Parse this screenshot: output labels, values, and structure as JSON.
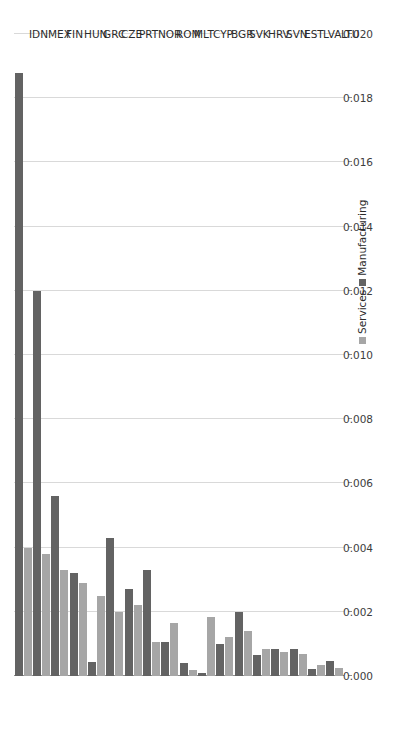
{
  "chart_data": {
    "type": "bar",
    "orientation": "horizontal",
    "title": "",
    "subtitle": "",
    "xlabel": "",
    "ylabel": "",
    "xlim": [
      0.0,
      0.02
    ],
    "xticks": [
      "0.020",
      "0.018",
      "0.016",
      "0.014",
      "0.012",
      "0.010",
      "0.008",
      "0.006",
      "0.004",
      "0.002",
      "0.000"
    ],
    "xtick_values": [
      0.02,
      0.018,
      0.016,
      0.014,
      0.012,
      0.01,
      0.008,
      0.006,
      0.004,
      0.002,
      0.0
    ],
    "x_axis_reversed": true,
    "grid": "vertical",
    "legend_position": "bottom-right",
    "categories": [
      "IDN",
      "MEX",
      "FIN",
      "HUN",
      "GRC",
      "CZE",
      "PRT",
      "NOR",
      "ROM",
      "MLT",
      "CYP",
      "BGR",
      "SVK",
      "HRV",
      "SVN",
      "EST",
      "LVA",
      "LTU"
    ],
    "series": [
      {
        "name": "Services",
        "color": "#a6a6a6",
        "values": [
          0.004,
          0.0038,
          0.0033,
          0.0029,
          0.0025,
          0.002,
          0.0022,
          0.00105,
          0.00165,
          0.00018,
          0.00185,
          0.0012,
          0.0014,
          0.00085,
          0.00075,
          0.00068,
          0.00035,
          0.00026
        ]
      },
      {
        "name": "Manufacturing",
        "color": "#636363",
        "values": [
          0.0188,
          0.012,
          0.0056,
          0.0032,
          0.00045,
          0.0043,
          0.0027,
          0.0033,
          0.00105,
          0.0004,
          0.0001,
          0.001,
          0.002,
          0.00065,
          0.00085,
          0.00085,
          0.00022,
          0.00048
        ]
      }
    ]
  },
  "legend": {
    "items": [
      {
        "label": "Services",
        "color": "#a6a6a6"
      },
      {
        "label": "Manufacturing",
        "color": "#636363"
      }
    ]
  },
  "colors": {
    "services": "#a6a6a6",
    "manufacturing": "#636363",
    "grid": "#d9d9d9",
    "axis": "#8c8c8c",
    "text": "#2b2b2b",
    "background": "#ffffff"
  }
}
